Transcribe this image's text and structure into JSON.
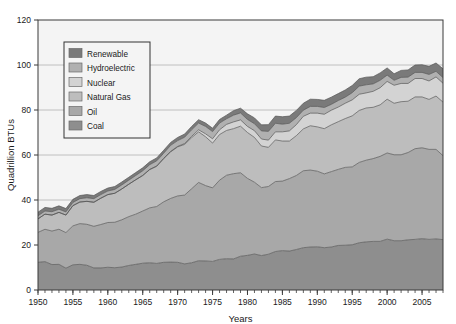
{
  "chart_data": {
    "type": "area",
    "title": "",
    "subtitle": "",
    "xlabel": "Years",
    "ylabel": "Quadrillion BTUs",
    "xlim": [
      1950,
      2008
    ],
    "ylim": [
      0,
      120
    ],
    "yticks": [
      0,
      20,
      40,
      60,
      80,
      100,
      120
    ],
    "ytick_labels": [
      "0",
      "20",
      "40",
      "60",
      "80",
      "100",
      "120"
    ],
    "xticks": [
      1950,
      1955,
      1960,
      1965,
      1970,
      1975,
      1980,
      1985,
      1990,
      1995,
      2000,
      2005
    ],
    "xtick_labels": [
      "1950",
      "1955",
      "1960",
      "1965",
      "1970",
      "1975",
      "1980",
      "1985",
      "1990",
      "1995",
      "2000",
      "2005"
    ],
    "x_minor_tick_step": 1,
    "grid": "horizontal-major",
    "stacked": true,
    "stack_order_bottom_to_top": [
      "Coal",
      "Oil",
      "Natural Gas",
      "Nuclear",
      "Hydroelectric",
      "Renewable"
    ],
    "legend_position": "upper-left-inside",
    "legend_order_top_to_bottom": [
      "Renewable",
      "Hydroelectric",
      "Nuclear",
      "Natural Gas",
      "Oil",
      "Coal"
    ],
    "x": [
      1950,
      1951,
      1952,
      1953,
      1954,
      1955,
      1956,
      1957,
      1958,
      1959,
      1960,
      1961,
      1962,
      1963,
      1964,
      1965,
      1966,
      1967,
      1968,
      1969,
      1970,
      1971,
      1972,
      1973,
      1974,
      1975,
      1976,
      1977,
      1978,
      1979,
      1980,
      1981,
      1982,
      1983,
      1984,
      1985,
      1986,
      1987,
      1988,
      1989,
      1990,
      1991,
      1992,
      1993,
      1994,
      1995,
      1996,
      1997,
      1998,
      1999,
      2000,
      2001,
      2002,
      2003,
      2004,
      2005,
      2006,
      2007,
      2008
    ],
    "series": [
      {
        "name": "Coal",
        "color": "#8e8e8e",
        "values": [
          12.3,
          12.6,
          11.3,
          11.4,
          9.7,
          11.2,
          11.4,
          11.0,
          9.8,
          9.8,
          10.1,
          9.9,
          10.2,
          10.9,
          11.4,
          11.9,
          12.1,
          11.8,
          12.3,
          12.4,
          12.3,
          11.6,
          12.1,
          13.0,
          12.9,
          12.7,
          13.6,
          13.9,
          13.8,
          15.0,
          15.4,
          16.0,
          15.3,
          15.9,
          17.1,
          17.5,
          17.3,
          18.0,
          18.8,
          19.1,
          19.2,
          18.8,
          19.1,
          19.8,
          19.9,
          20.1,
          21.0,
          21.4,
          21.6,
          21.6,
          22.6,
          21.9,
          21.9,
          22.3,
          22.5,
          22.8,
          22.5,
          22.7,
          22.4
        ]
      },
      {
        "name": "Oil",
        "color": "#a8a8a8",
        "values": [
          13.3,
          14.4,
          14.9,
          15.6,
          15.8,
          17.3,
          18.1,
          18.2,
          18.5,
          19.3,
          19.9,
          20.2,
          21.0,
          21.7,
          22.3,
          23.2,
          24.4,
          25.3,
          26.9,
          28.3,
          29.5,
          30.6,
          32.9,
          34.8,
          33.5,
          32.7,
          35.2,
          37.1,
          37.9,
          37.1,
          34.2,
          31.9,
          30.2,
          30.1,
          31.1,
          30.9,
          32.2,
          32.9,
          34.2,
          34.2,
          33.6,
          32.8,
          33.5,
          33.8,
          34.6,
          34.6,
          35.7,
          36.3,
          36.8,
          37.8,
          38.3,
          38.2,
          38.2,
          38.8,
          40.3,
          40.4,
          40.0,
          39.8,
          37.3
        ]
      },
      {
        "name": "Natural Gas",
        "color": "#bdbdbd",
        "values": [
          6.0,
          6.7,
          7.1,
          7.5,
          7.8,
          9.0,
          9.6,
          10.2,
          10.7,
          11.7,
          12.4,
          12.9,
          13.7,
          14.4,
          15.3,
          15.8,
          17.0,
          17.9,
          19.2,
          20.7,
          21.8,
          22.5,
          22.7,
          22.5,
          21.7,
          19.9,
          20.3,
          19.9,
          20.0,
          20.7,
          20.4,
          19.9,
          18.5,
          17.4,
          18.5,
          17.8,
          16.7,
          17.7,
          18.6,
          19.7,
          19.7,
          20.1,
          20.8,
          21.2,
          21.7,
          22.7,
          23.1,
          23.2,
          22.8,
          22.9,
          23.9,
          22.9,
          23.6,
          22.8,
          23.0,
          22.6,
          22.2,
          23.7,
          23.8
        ]
      },
      {
        "name": "Nuclear",
        "color": "#d3d3d3",
        "values": [
          0.0,
          0.0,
          0.0,
          0.0,
          0.0,
          0.0,
          0.0,
          0.0,
          0.0,
          0.0,
          0.0,
          0.0,
          0.0,
          0.0,
          0.0,
          0.0,
          0.1,
          0.1,
          0.1,
          0.2,
          0.2,
          0.4,
          0.6,
          0.9,
          1.3,
          1.9,
          2.1,
          2.7,
          3.0,
          2.8,
          2.7,
          3.0,
          3.1,
          3.2,
          3.6,
          4.1,
          4.5,
          4.9,
          5.6,
          5.6,
          6.1,
          6.4,
          6.5,
          6.5,
          6.8,
          7.1,
          7.2,
          6.7,
          7.1,
          7.6,
          7.9,
          8.0,
          8.1,
          7.9,
          8.2,
          8.2,
          8.2,
          8.5,
          8.4
        ]
      },
      {
        "name": "Hydroelectric",
        "color": "#b0b0b0",
        "values": [
          1.4,
          1.4,
          1.5,
          1.4,
          1.4,
          1.4,
          1.5,
          1.6,
          1.6,
          1.6,
          1.6,
          1.7,
          1.8,
          1.8,
          1.9,
          2.1,
          2.1,
          2.3,
          2.3,
          2.7,
          2.6,
          2.8,
          2.9,
          3.0,
          3.3,
          3.2,
          3.0,
          2.5,
          3.0,
          3.1,
          3.1,
          3.1,
          3.6,
          3.9,
          3.8,
          3.4,
          3.4,
          3.1,
          2.7,
          3.0,
          3.0,
          3.0,
          2.6,
          2.9,
          2.7,
          3.2,
          3.6,
          3.6,
          3.3,
          3.3,
          2.8,
          2.2,
          2.7,
          2.8,
          2.7,
          2.7,
          2.9,
          2.5,
          2.5
        ]
      },
      {
        "name": "Renewable",
        "color": "#7a7a7a",
        "values": [
          1.6,
          1.6,
          1.5,
          1.5,
          1.5,
          1.4,
          1.4,
          1.4,
          1.4,
          1.4,
          1.3,
          1.3,
          1.3,
          1.3,
          1.3,
          1.3,
          1.3,
          1.3,
          1.3,
          1.3,
          1.4,
          1.4,
          1.5,
          1.5,
          1.5,
          1.5,
          1.6,
          1.6,
          2.0,
          2.1,
          2.5,
          2.6,
          2.7,
          3.0,
          3.2,
          3.3,
          3.2,
          3.2,
          3.1,
          3.2,
          3.1,
          3.2,
          3.2,
          3.1,
          3.2,
          3.2,
          3.3,
          3.4,
          3.2,
          3.3,
          3.2,
          2.9,
          3.1,
          3.2,
          3.3,
          3.4,
          3.6,
          3.7,
          3.9
        ]
      }
    ],
    "totals_note": "Total primary energy consumption rises from about 34 in 1950 to about 101 in 2007, with dips after 1973 and 1979."
  },
  "legend": {
    "items": [
      {
        "label": "Renewable",
        "color": "#7a7a7a"
      },
      {
        "label": "Hydroelectric",
        "color": "#b0b0b0"
      },
      {
        "label": "Nuclear",
        "color": "#d3d3d3"
      },
      {
        "label": "Natural Gas",
        "color": "#bdbdbd"
      },
      {
        "label": "Oil",
        "color": "#a8a8a8"
      },
      {
        "label": "Coal",
        "color": "#8e8e8e"
      }
    ]
  },
  "style": {
    "plot_background": "#f4f4f4",
    "figure_background": "#ffffff",
    "axis_color": "#3a3a3a",
    "grid_color": "#b9b9b9",
    "area_edge_color": "#555555",
    "legend_background": "#f4f4f4",
    "legend_border": "#333333"
  }
}
